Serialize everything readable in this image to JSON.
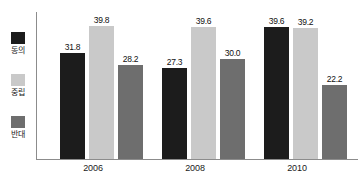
{
  "chart_data": {
    "type": "bar",
    "title": "",
    "subtitle": "",
    "xlabel": "",
    "ylabel": "",
    "categories": [
      "2006",
      "2008",
      "2010"
    ],
    "series": [
      {
        "name": "동의",
        "color": "#1c1c1c",
        "values": [
          31.8,
          27.3,
          39.6
        ]
      },
      {
        "name": "중립",
        "color": "#c9c9c9",
        "values": [
          39.8,
          39.6,
          39.2
        ]
      },
      {
        "name": "반대",
        "color": "#6e6e6e",
        "values": [
          28.2,
          30.0,
          22.2
        ]
      }
    ],
    "value_labels": [
      [
        "31.8",
        "39.8",
        "28.2"
      ],
      [
        "27.3",
        "39.6",
        "30.0"
      ],
      [
        "39.6",
        "39.2",
        "22.2"
      ]
    ],
    "ylim": [
      0,
      44
    ],
    "grid": false,
    "legend_position": "left",
    "axis_color": "#8c8c8c"
  },
  "legend": {
    "items": [
      {
        "label": "동의",
        "swatch": "#1c1c1c"
      },
      {
        "label": "중립",
        "swatch": "#c9c9c9"
      },
      {
        "label": "반대",
        "swatch": "#6e6e6e"
      }
    ]
  },
  "xaxis": {
    "ticks": [
      "2006",
      "2008",
      "2010"
    ]
  }
}
